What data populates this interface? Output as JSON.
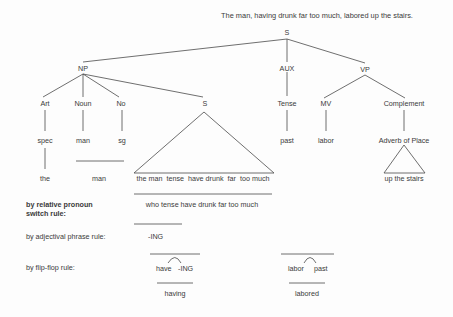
{
  "title": "The man, having drunk far too much, labored up the stairs.",
  "tree": {
    "root": "S",
    "level1": {
      "np": "NP",
      "aux": "AUX",
      "vp": "VP"
    },
    "level2": {
      "art": "Art",
      "noun": "Noun",
      "no": "No",
      "s_embedded": "S",
      "tense": "Tense",
      "mv": "MV",
      "complement": "Complement"
    },
    "level3": {
      "spec": "spec",
      "man": "man",
      "sg": "sg",
      "past": "past",
      "labor": "labor",
      "adverb_of_place": "Adverb of Place"
    },
    "level4": {
      "the": "the",
      "man": "man",
      "embedded_string": "the man  tense  have drunk  far  too much",
      "up_the_stairs": "up the stairs"
    }
  },
  "derivation": {
    "rules": [
      {
        "label_line1": "by relative pronoun",
        "label_line2": "switch rule:",
        "result": "who tense have drunk far too much"
      },
      {
        "label_line1": "by adjectival phrase rule:",
        "result": "-ING"
      },
      {
        "label_line1": "by flip-flop rule:",
        "items": [
          {
            "left": "have",
            "right": "-ING",
            "result": "having"
          },
          {
            "left": "labor",
            "right": "past",
            "result": "labored"
          }
        ]
      }
    ]
  }
}
